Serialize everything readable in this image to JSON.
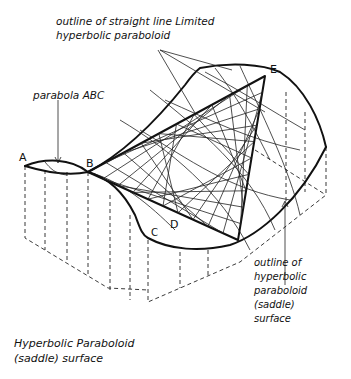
{
  "diagram": {
    "title_line1": "Hyperbolic Paraboloid",
    "title_line2": "(saddle) surface",
    "annotations": {
      "top_line1": "outline of straight line Limited",
      "top_line2": "hyperbolic paraboloid",
      "parabola": "parabola ABC",
      "right_line1": "outline of",
      "right_line2": "hyperbolic",
      "right_line3": "paraboloid",
      "right_line4": "(saddle)",
      "right_line5": "surface"
    },
    "points": {
      "A": "A",
      "B": "B",
      "C": "C",
      "D": "D",
      "E": "E"
    }
  }
}
